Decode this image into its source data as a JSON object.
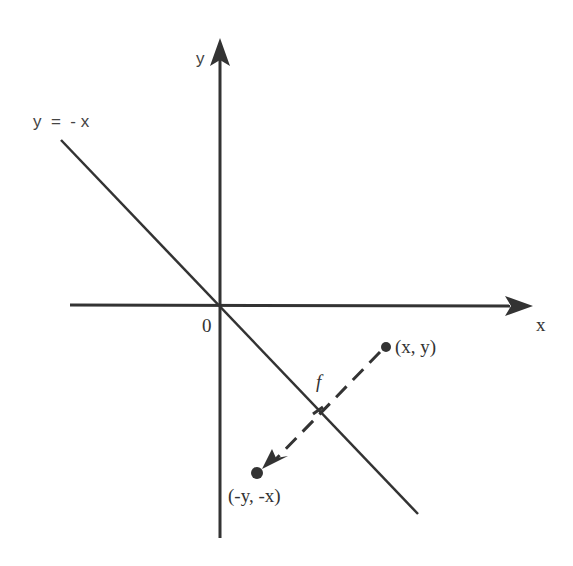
{
  "diagram": {
    "type": "reflection across line y = -x",
    "labels": {
      "y_axis": "y",
      "x_axis": "x",
      "origin": "0",
      "line": "y  =  - x",
      "point": "(x, y)",
      "image_point": "(-y, -x)",
      "map": "f"
    },
    "colors": {
      "stroke": "#333333",
      "background": "#ffffff"
    }
  }
}
